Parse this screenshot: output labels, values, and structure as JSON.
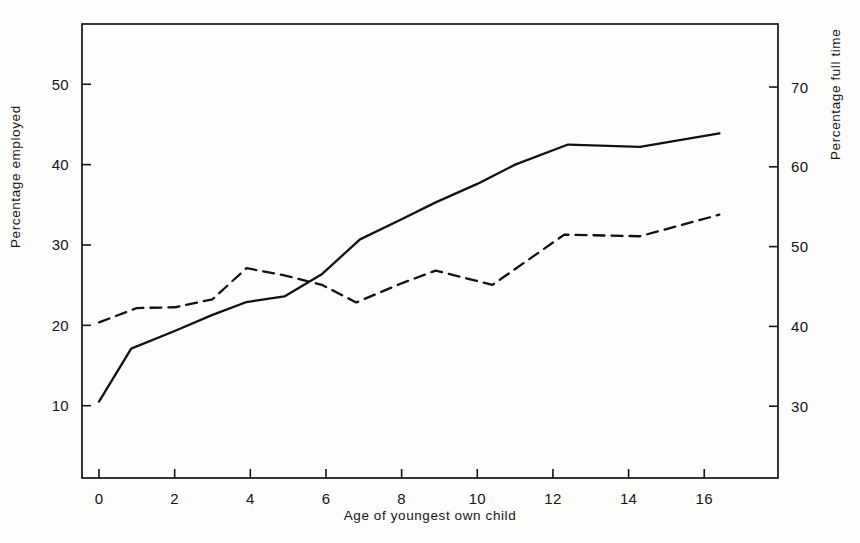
{
  "chart_data": {
    "type": "line",
    "title": "",
    "xlabel": "Age of youngest own child",
    "ylabel": "Percentage employed",
    "ylabel_right": "Percentage full time",
    "xlim": [
      -0.45,
      17.95
    ],
    "ylim": [
      1.0,
      57.5
    ],
    "ylim_right": [
      21.0,
      77.9
    ],
    "grid": false,
    "legend": null,
    "xticks": [
      "0",
      "2",
      "4",
      "6",
      "8",
      "10",
      "12",
      "14",
      "16"
    ],
    "xtick_values": [
      0,
      2,
      4,
      6,
      8,
      10,
      12,
      14,
      16
    ],
    "yticks_left": [
      "10",
      "20",
      "30",
      "40",
      "50"
    ],
    "ytick_values_left": [
      10,
      20,
      30,
      40,
      50
    ],
    "yticks_right": [
      "30",
      "40",
      "50",
      "60",
      "70"
    ],
    "ytick_values_right": [
      30,
      40,
      50,
      60,
      70
    ],
    "series": [
      {
        "name": "Percentage employed",
        "axis": "left",
        "style": "solid",
        "color": "#121212",
        "x": [
          0.0,
          0.85,
          2.0,
          3.0,
          3.9,
          4.9,
          5.9,
          6.9,
          8.0,
          8.9,
          10.0,
          11.0,
          12.4,
          14.3,
          16.4
        ],
        "y": [
          10.5,
          17.1,
          19.3,
          21.3,
          22.9,
          23.6,
          26.4,
          30.7,
          33.2,
          35.3,
          37.6,
          40.0,
          42.5,
          42.2,
          43.9
        ]
      },
      {
        "name": "Percentage full time",
        "axis": "right",
        "style": "dashed",
        "color": "#121212",
        "x": [
          0.0,
          1.0,
          2.0,
          3.0,
          3.9,
          4.9,
          5.9,
          6.8,
          8.0,
          8.9,
          10.4,
          12.3,
          14.3,
          16.4
        ],
        "y": [
          40.5,
          42.3,
          42.4,
          43.4,
          47.3,
          46.4,
          45.2,
          43.0,
          45.4,
          47.0,
          45.2,
          51.5,
          51.3,
          54.0
        ]
      }
    ]
  },
  "axes": {
    "left_title": "Percentage employed",
    "right_title": "Percentage full time",
    "bottom_title": "Age of youngest own child"
  }
}
